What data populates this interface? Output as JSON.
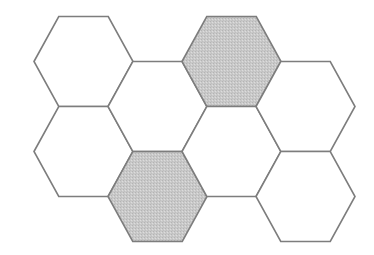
{
  "figure": {
    "type": "geometric-figure",
    "canvas": {
      "width": 374,
      "height": 255
    },
    "background_color": "#ffffff",
    "stroke_color": "#7d7d7d",
    "stroke_width": 1.6,
    "shaded_fill_color": "#c9c9c9",
    "unshaded_fill_color": "#ffffff",
    "shaded_texture": "dithered-noise",
    "hexagon_orientation": "flat-top",
    "hexagon_width": 99,
    "hexagon_height": 90,
    "column_step_x": 74,
    "row_step_y": 90,
    "column_offset_y": 45,
    "shaded_count": 2,
    "unshaded_count": 6,
    "total_count": 8,
    "cells": [
      {
        "id": "hex-a1",
        "column": "A",
        "row": 1,
        "cx": 83.5,
        "cy": 61.5,
        "shaded": false,
        "label": "A1"
      },
      {
        "id": "hex-a2",
        "column": "A",
        "row": 2,
        "cx": 83.5,
        "cy": 151.5,
        "shaded": false,
        "label": "A2"
      },
      {
        "id": "hex-b1",
        "column": "B",
        "row": 1,
        "cx": 157.5,
        "cy": 106.5,
        "shaded": false,
        "label": "B1"
      },
      {
        "id": "hex-b2",
        "column": "B",
        "row": 2,
        "cx": 157.5,
        "cy": 196.5,
        "shaded": true,
        "label": "B2"
      },
      {
        "id": "hex-c1",
        "column": "C",
        "row": 1,
        "cx": 231.5,
        "cy": 61.5,
        "shaded": true,
        "label": "C1"
      },
      {
        "id": "hex-c2",
        "column": "C",
        "row": 2,
        "cx": 231.5,
        "cy": 151.5,
        "shaded": false,
        "label": "C2"
      },
      {
        "id": "hex-d1",
        "column": "D",
        "row": 1,
        "cx": 305.5,
        "cy": 106.5,
        "shaded": false,
        "label": "D1"
      },
      {
        "id": "hex-d2",
        "column": "D",
        "row": 2,
        "cx": 305.5,
        "cy": 196.5,
        "shaded": false,
        "label": "D2"
      }
    ]
  }
}
